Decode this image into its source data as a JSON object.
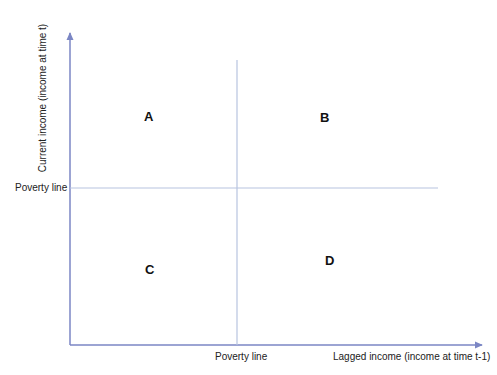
{
  "diagram": {
    "type": "quadrant",
    "x_axis": {
      "title": "Lagged income (income at time t-1)",
      "threshold_label": "Poverty line"
    },
    "y_axis": {
      "title": "Current income (income at time t)",
      "threshold_label": "Poverty line"
    },
    "quadrants": [
      {
        "id": "A",
        "label": "A",
        "position": "top-left"
      },
      {
        "id": "B",
        "label": "B",
        "position": "top-right"
      },
      {
        "id": "C",
        "label": "C",
        "position": "bottom-left"
      },
      {
        "id": "D",
        "label": "D",
        "position": "bottom-right"
      }
    ],
    "colors": {
      "axis": "#7b86c4",
      "poverty_lines": "#b8c4e0",
      "text": "#222222"
    }
  }
}
